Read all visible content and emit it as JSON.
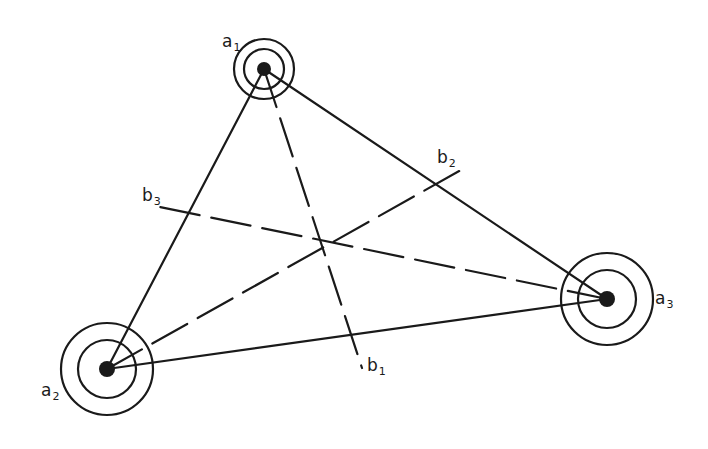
{
  "diagram": {
    "type": "triangle-with-medians",
    "stroke_color": "#1a1a1a",
    "background": "#ffffff",
    "nodes": [
      {
        "id": "a1",
        "label": "a",
        "subscript": "1",
        "x": 264,
        "y": 69,
        "outer_r": 30,
        "inner_r": 20,
        "dot_r": 7,
        "label_x": 222,
        "label_y": 47
      },
      {
        "id": "a2",
        "label": "a",
        "subscript": "2",
        "x": 107,
        "y": 369,
        "outer_r": 46,
        "inner_r": 29,
        "dot_r": 8,
        "label_x": 41,
        "label_y": 396
      },
      {
        "id": "a3",
        "label": "a",
        "subscript": "3",
        "x": 607,
        "y": 299,
        "outer_r": 46,
        "inner_r": 29,
        "dot_r": 8,
        "label_x": 655,
        "label_y": 304
      }
    ],
    "edges": [
      {
        "from": "a1",
        "to": "a2",
        "style": "solid"
      },
      {
        "from": "a2",
        "to": "a3",
        "style": "solid"
      },
      {
        "from": "a1",
        "to": "a3",
        "style": "solid"
      }
    ],
    "medians": [
      {
        "from": "a1",
        "end": {
          "x": 362,
          "y": 368
        },
        "label": "b",
        "subscript": "1",
        "label_x": 367,
        "label_y": 371,
        "style": "dashed"
      },
      {
        "from": "a2",
        "end": {
          "x": 461,
          "y": 170
        },
        "label": "b",
        "subscript": "2",
        "label_x": 437,
        "label_y": 163,
        "style": "dashed"
      },
      {
        "from": "a3",
        "end": {
          "x": 155,
          "y": 206
        },
        "label": "b",
        "subscript": "3",
        "label_x": 142,
        "label_y": 201,
        "style": "dashed"
      }
    ],
    "centroid": {
      "x": 322,
      "y": 243
    }
  }
}
